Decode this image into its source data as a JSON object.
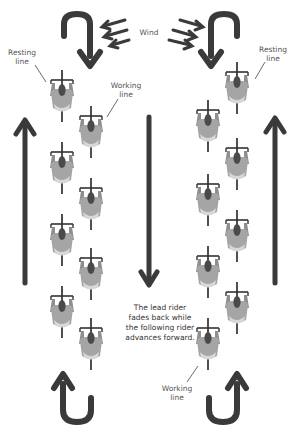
{
  "labels": {
    "wind": "Wind",
    "resting_line_left": "Resting line",
    "working_line_left": "Working line",
    "resting_line_right": "Resting line",
    "working_line_right": "Working line",
    "description": "The lead rider fades back while the following rider advances forward."
  },
  "icons": {
    "wind": "wind-arrows-icon",
    "rider": "cyclist-top-view-icon",
    "u_turn": "u-turn-arrow-icon",
    "arrow_up": "arrow-up-icon",
    "arrow_down": "arrow-down-icon"
  },
  "colors": {
    "arrow": "#3a3a3a",
    "rider_body": "#9a9a9a",
    "rider_dark": "#4a4a4a",
    "line": "#222222",
    "text": "#555555"
  },
  "left_group": {
    "resting_riders": [
      88,
      160,
      232,
      302
    ],
    "working_riders": [
      124,
      196,
      268,
      338
    ]
  },
  "right_group": {
    "resting_riders": [
      80,
      156,
      228,
      300
    ],
    "working_riders": [
      116,
      190,
      262,
      334
    ]
  }
}
